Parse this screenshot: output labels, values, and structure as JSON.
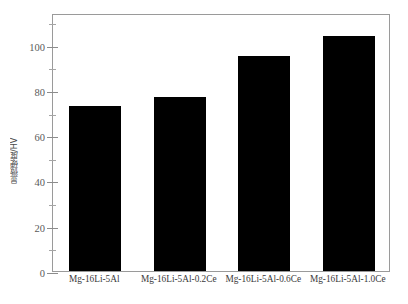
{
  "figure": {
    "background_color": "#ffffff",
    "frame_color": "#9a9a9a",
    "bar_color": "#000000"
  },
  "axes": {
    "ylabel": "显微硬度/HV",
    "xlabel": "",
    "ytick_labels": [
      "0",
      "20",
      "40",
      "60",
      "80",
      "100"
    ],
    "ytick_values": [
      0,
      20,
      40,
      60,
      80,
      100
    ]
  },
  "chart_data": {
    "type": "bar",
    "title": "",
    "xlabel": "",
    "ylabel": "显微硬度/HV",
    "categories": [
      "Mg-16Li-5Al",
      "Mg-16Li-5Al-0.2Ce",
      "Mg-16Li-5Al-0.6Ce",
      "Mg-16Li-5Al-1.0Ce"
    ],
    "values": [
      73,
      77,
      95,
      104
    ],
    "ylim": [
      0,
      114
    ],
    "yticks": [
      0,
      20,
      40,
      60,
      80,
      100
    ],
    "minor_yticks": [
      10,
      30,
      50,
      70,
      90,
      110
    ],
    "grid": false,
    "legend": false,
    "bar_color": "#000000",
    "bar_width_frac": 0.62
  }
}
